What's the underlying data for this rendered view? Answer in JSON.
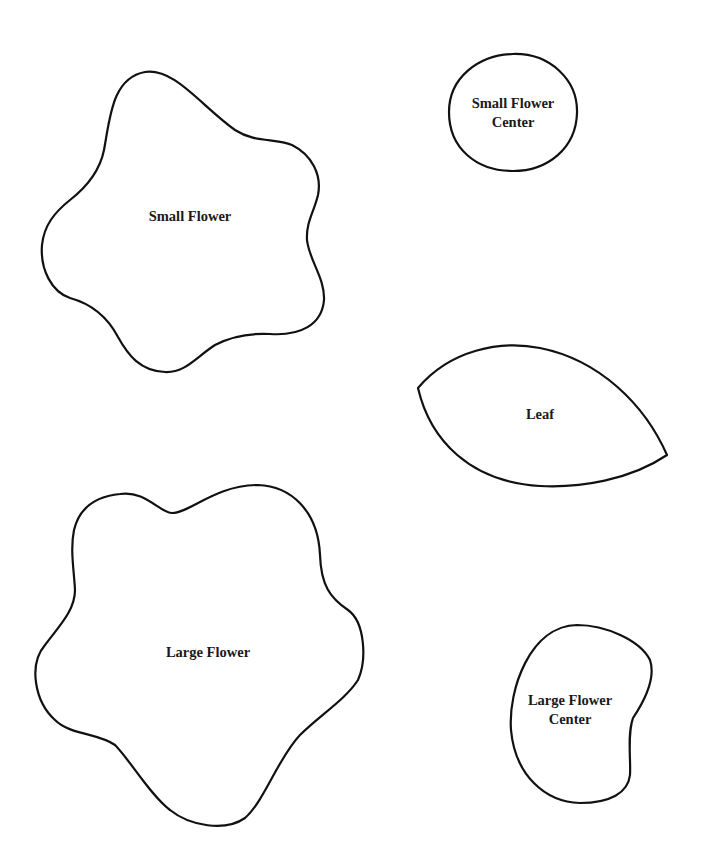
{
  "page": {
    "background_color": "#ffffff",
    "stroke_color": "#111111",
    "text_color": "#1a1a1a"
  },
  "pieces": {
    "small_flower": {
      "label": "Small Flower"
    },
    "small_flower_center": {
      "label_line1": "Small Flower",
      "label_line2": "Center"
    },
    "leaf": {
      "label": "Leaf"
    },
    "large_flower": {
      "label": "Large Flower"
    },
    "large_flower_center": {
      "label_line1": "Large Flower",
      "label_line2": "Center"
    }
  }
}
